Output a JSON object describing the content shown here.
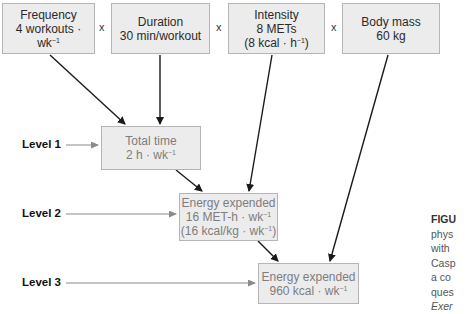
{
  "inputs": [
    {
      "title": "Frequency",
      "value": "4 workouts · wk",
      "sup": "−1",
      "extra": ""
    },
    {
      "title": "Duration",
      "value": "30 min/workout",
      "sup": "",
      "extra": ""
    },
    {
      "title": "Intensity",
      "value": "8 METs",
      "sup": "",
      "extra": "(8 kcal · h",
      "extra_sup": "−1",
      "extra_end": ")"
    },
    {
      "title": "Body mass",
      "value": "60 kg",
      "sup": "",
      "extra": ""
    }
  ],
  "operators": [
    "x",
    "x",
    "x"
  ],
  "levels": [
    {
      "label": "Level 1",
      "box_title": "Total time",
      "box_value": "2 h · wk",
      "box_sup": "−1"
    },
    {
      "label": "Level 2",
      "box_title": "Energy expended",
      "box_value": "16 MET-h · wk",
      "box_sup": "−1",
      "box_extra": "(16 kcal/kg · wk",
      "box_extra_sup": "−1",
      "box_extra_end": ")"
    },
    {
      "label": "Level 3",
      "box_title": "Energy expended",
      "box_value": "960 kcal · wk",
      "box_sup": "−1"
    }
  ],
  "caption": {
    "lines": [
      "FIGU",
      "phys",
      "with",
      "Casp",
      "a co",
      "ques",
      "Exer"
    ]
  },
  "colors": {
    "box_fill": "#ececec",
    "box_border": "#b5b5b5",
    "arrow_dark": "#1a1a1a",
    "arrow_gray": "#8a8a8a"
  }
}
